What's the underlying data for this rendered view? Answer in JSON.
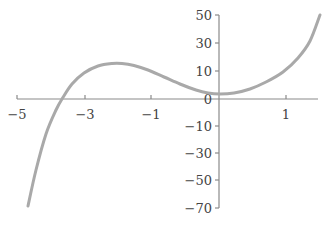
{
  "chart_data": {
    "type": "line",
    "title": "",
    "xlabel": "",
    "ylabel": "",
    "grid": false,
    "legend": null,
    "x_ticks": [
      {
        "label": "-5",
        "px": 17
      },
      {
        "label": "-3",
        "px": 85
      },
      {
        "label": "-1",
        "px": 151
      },
      {
        "label": "1",
        "px": 286
      }
    ],
    "y_ticks": [
      {
        "label": "50",
        "py": 15
      },
      {
        "label": "30",
        "py": 43
      },
      {
        "label": "10",
        "py": 71
      },
      {
        "label": "0",
        "py": 99
      },
      {
        "label": "-10",
        "py": 126
      },
      {
        "label": "-30",
        "py": 153
      },
      {
        "label": "-50",
        "py": 180
      },
      {
        "label": "-70",
        "py": 208
      }
    ],
    "axes": {
      "x_axis": {
        "y": 99,
        "x_start": 17,
        "x_end": 318
      },
      "y_axis": {
        "x": 219,
        "y_start": 15,
        "y_end": 208
      }
    },
    "series": [
      {
        "name": "cubic curve",
        "color": "#a9a9a9",
        "description": "Cubic polynomial: rises from bottom-left, crosses x-axis near -3.5, local max ~13 near x=-2, local min ~2 near x=0, rises to ~50 at right edge",
        "points_px": [
          [
            28,
            206
          ],
          [
            36,
            170
          ],
          [
            46,
            134
          ],
          [
            56,
            110
          ],
          [
            62,
            99
          ],
          [
            72,
            84
          ],
          [
            84,
            73
          ],
          [
            98,
            66
          ],
          [
            112,
            63.5
          ],
          [
            122,
            63.5
          ],
          [
            134,
            65.5
          ],
          [
            148,
            70
          ],
          [
            164,
            77
          ],
          [
            180,
            84
          ],
          [
            196,
            90
          ],
          [
            208,
            93
          ],
          [
            220,
            94
          ],
          [
            234,
            93
          ],
          [
            250,
            89
          ],
          [
            266,
            82
          ],
          [
            283,
            72
          ],
          [
            298,
            58
          ],
          [
            310,
            41
          ],
          [
            320,
            15
          ]
        ],
        "approx_values": [
          {
            "x": -4.7,
            "y": -70
          },
          {
            "x": -3.7,
            "y": 0
          },
          {
            "x": -2,
            "y": 13
          },
          {
            "x": 0,
            "y": 2
          },
          {
            "x": 1,
            "y": 10
          },
          {
            "x": 1.5,
            "y": 50
          }
        ]
      }
    ]
  }
}
